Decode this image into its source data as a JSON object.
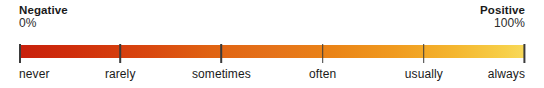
{
  "chart_data": {
    "type": "heatmap",
    "title": "",
    "subtitle": "",
    "xlabel": "",
    "ylabel": "",
    "orientation": "horizontal",
    "grid": false,
    "legend_position": "none",
    "scale_kind": "continuous-colorbar-with-ordinal-ticks",
    "xlim": [
      0,
      100
    ],
    "endpoints": [
      {
        "name": "negative-endpoint",
        "title": "Negative",
        "value": "0%",
        "numeric": 0,
        "align": "left",
        "color": "#c8200c"
      },
      {
        "name": "positive-endpoint",
        "title": "Positive",
        "value": "100%",
        "numeric": 100,
        "align": "right",
        "color": "#f8d95a"
      }
    ],
    "categories": [
      "never",
      "rarely",
      "sometimes",
      "often",
      "usually",
      "always"
    ],
    "values": [
      0,
      20,
      40,
      60,
      80,
      100
    ],
    "tick_positions_pct": [
      0,
      20,
      40,
      60,
      80,
      100
    ],
    "tick_color": "#3b3b3b",
    "gradient": {
      "from": "#c8200c",
      "mid": "#e5721a",
      "to": "#f8d95a",
      "stops": [
        {
          "pct": 0,
          "color": "#c8200c"
        },
        {
          "pct": 10,
          "color": "#cf2d0b"
        },
        {
          "pct": 26,
          "color": "#d9480f"
        },
        {
          "pct": 38,
          "color": "#e06312"
        },
        {
          "pct": 50,
          "color": "#e5721a"
        },
        {
          "pct": 62,
          "color": "#ea8417"
        },
        {
          "pct": 74,
          "color": "#f09a1f"
        },
        {
          "pct": 86,
          "color": "#f4b62f"
        },
        {
          "pct": 96,
          "color": "#f7cf48"
        },
        {
          "pct": 100,
          "color": "#f8d95a"
        }
      ]
    },
    "text_color": "#1a1a1a",
    "background": "#ffffff"
  }
}
